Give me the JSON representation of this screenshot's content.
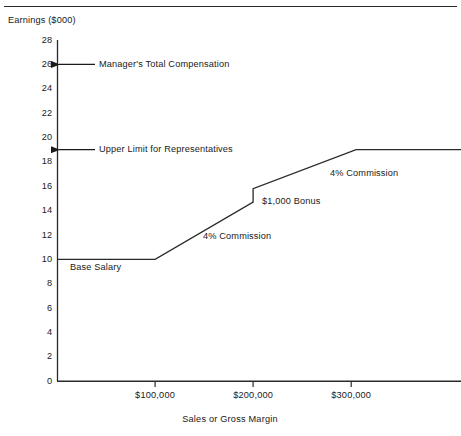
{
  "figure": {
    "top_rule": true,
    "title_ghost": ""
  },
  "chart_data": {
    "type": "line",
    "title": "",
    "xlabel": "Sales or Gross Margin",
    "ylabel": "Earnings ($000)",
    "xlim": [
      0,
      412000
    ],
    "ylim": [
      0,
      28
    ],
    "grid": false,
    "legend": "none",
    "yticks": [
      0,
      2,
      4,
      6,
      8,
      10,
      12,
      14,
      16,
      18,
      20,
      22,
      24,
      26,
      28
    ],
    "ytick_labels": [
      "0",
      "2",
      "4",
      "6",
      "8",
      "10",
      "12",
      "14",
      "16",
      "18",
      "20",
      "22",
      "24",
      "26",
      "28"
    ],
    "xticks": [
      100000,
      200000,
      300000
    ],
    "xtick_labels": [
      "$100,000",
      "$200,000",
      "$300,000"
    ],
    "series": [
      {
        "name": "Representative earnings",
        "points": [
          {
            "x": 0,
            "y": 10
          },
          {
            "x": 100000,
            "y": 10
          },
          {
            "x": 200000,
            "y": 14.7
          },
          {
            "x": 200000,
            "y": 15.8
          },
          {
            "x": 305000,
            "y": 19
          },
          {
            "x": 412000,
            "y": 19
          }
        ]
      }
    ],
    "annotations": [
      {
        "label": "Manager's Total Compensation",
        "value": 26,
        "type": "arrow-to-axis"
      },
      {
        "label": "Upper Limit for Representatives",
        "value": 19,
        "type": "arrow-to-axis"
      },
      {
        "label": "Base Salary",
        "value": 10,
        "type": "segment-label"
      },
      {
        "label": "4% Commission",
        "value": 12.3,
        "type": "segment-label"
      },
      {
        "label": "$1,000 Bonus",
        "value": 15.2,
        "type": "step-label"
      },
      {
        "label": "4% Commission",
        "value": 17.2,
        "type": "segment-label"
      }
    ]
  }
}
